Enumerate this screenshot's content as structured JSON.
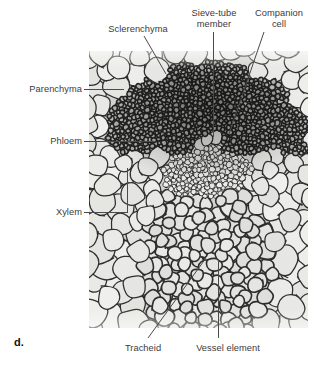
{
  "figure": {
    "marker": "d.",
    "caption_subject": "plant vascular bundle cross section micrograph"
  },
  "micrograph": {
    "name": "vascular-bundle-micrograph",
    "x": 89,
    "y": 51,
    "width": 219,
    "height": 277,
    "base_color": "#d2d2ce",
    "wall_color": "#2e2e2e",
    "lumen_color": "#e6e6e2"
  },
  "labels": [
    {
      "id": "parenchyma",
      "text": "Parenchyma",
      "align": "right",
      "x": 6,
      "y": 84,
      "w": 76
    },
    {
      "id": "phloem",
      "text": "Phloem",
      "align": "right",
      "x": 6,
      "y": 136,
      "w": 76
    },
    {
      "id": "xylem",
      "text": "Xylem",
      "align": "right",
      "x": 6,
      "y": 207,
      "w": 76
    },
    {
      "id": "sclerenchyma",
      "text": "Sclerenchyma",
      "align": "center",
      "x": 94,
      "y": 24,
      "w": 88
    },
    {
      "id": "sieve-tube-member",
      "text": "Sieve-tube\nmember",
      "align": "center",
      "x": 183,
      "y": 8,
      "w": 62
    },
    {
      "id": "companion-cell",
      "text": "Companion\ncell",
      "align": "center",
      "x": 248,
      "y": 8,
      "w": 62
    },
    {
      "id": "tracheid",
      "text": "Tracheid",
      "align": "center",
      "x": 108,
      "y": 343,
      "w": 70
    },
    {
      "id": "vessel-element",
      "text": "Vessel element",
      "align": "center",
      "x": 185,
      "y": 343,
      "w": 86
    }
  ],
  "leaders": {
    "parenchyma": {
      "type": "horizontal",
      "x1": 84,
      "y1": 89,
      "x2": 124,
      "y2": 89
    },
    "phloem": {
      "type": "horizontal",
      "x1": 84,
      "y1": 141,
      "x2": 154,
      "y2": 141
    },
    "xylem_stem": {
      "type": "horizontal",
      "x1": 84,
      "y1": 212,
      "x2": 127,
      "y2": 212
    },
    "xylem_bracket": {
      "type": "vertical",
      "x1": 127,
      "y1": 168,
      "x2": 127,
      "y2": 213
    },
    "sclerenchyma": {
      "type": "diagonal",
      "x1": 144,
      "y1": 36,
      "x2": 166,
      "y2": 74
    },
    "sieve_tube_member": {
      "type": "vertical",
      "x1": 213,
      "y1": 32,
      "x2": 213,
      "y2": 137
    },
    "companion_cell": {
      "type": "diagonal",
      "x1": 264,
      "y1": 32,
      "x2": 229,
      "y2": 134
    },
    "tracheid": {
      "type": "diagonal",
      "x1": 148,
      "y1": 338,
      "x2": 206,
      "y2": 258
    },
    "vessel_element": {
      "type": "vertical",
      "x1": 218,
      "y1": 260,
      "x2": 218,
      "y2": 338
    }
  },
  "tissue_zones": [
    {
      "name": "parenchyma-outer",
      "cell_size_px": 20,
      "wall_thickness": 1.4,
      "tone": "light"
    },
    {
      "name": "sclerenchyma-band",
      "cell_size_px": 5,
      "wall_thickness": 2.1,
      "tone": "dark"
    },
    {
      "name": "phloem",
      "cell_size_px": 5,
      "wall_thickness": 1.0,
      "tone": "light"
    },
    {
      "name": "xylem",
      "cell_size_px": 15,
      "wall_thickness": 2.0,
      "tone": "medium"
    }
  ]
}
